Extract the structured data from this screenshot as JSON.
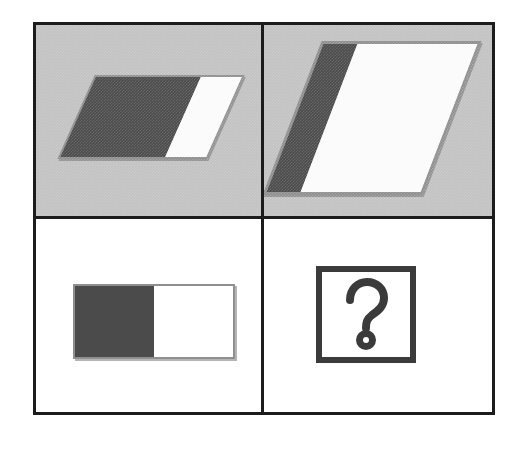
{
  "puzzle": {
    "title": "Visual analogy matrix",
    "layout": "2x2",
    "prompt": "A is to B as C is to ?",
    "cells": [
      {
        "id": "A",
        "position": "top-left",
        "background": "gray",
        "background_color": "#c2c2c2",
        "figure": "two-tone-rectangle",
        "skewed": "yes",
        "skew_label": "slanted",
        "dark_share": "72%",
        "light_share": "28%",
        "dark_color": "#4b4b4b",
        "light_color": "#fbfbfb",
        "orientation": "wide"
      },
      {
        "id": "B",
        "position": "top-right",
        "background": "gray",
        "background_color": "#c2c2c2",
        "figure": "two-tone-rectangle",
        "skewed": "yes",
        "skew_label": "slanted",
        "dark_share": "22%",
        "light_share": "78%",
        "dark_color": "#4b4b4b",
        "light_color": "#fbfbfb",
        "orientation": "tall"
      },
      {
        "id": "C",
        "position": "bottom-left",
        "background": "white",
        "background_color": "#ffffff",
        "figure": "two-tone-rectangle",
        "skewed": "no",
        "skew_label": "upright",
        "dark_share": "50%",
        "light_share": "50%",
        "dark_color": "#4b4b4b",
        "light_color": "#ffffff",
        "orientation": "wide"
      },
      {
        "id": "D",
        "position": "bottom-right",
        "background": "white",
        "background_color": "#ffffff",
        "figure": "question-mark-box",
        "glyph": "?",
        "glyph_name": "question-mark-icon",
        "box_border_color": "#3b3b3b",
        "answer_state": "unknown"
      }
    ],
    "frame": {
      "border_color": "#1c1c1c",
      "border_width_px": 3,
      "divider_color": "#1c1c1c"
    }
  }
}
